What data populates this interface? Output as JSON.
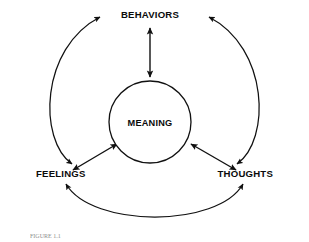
{
  "figure": {
    "background_color": "#ffffff",
    "stroke_color": "#111111",
    "text_color": "#0b0b0b",
    "caption": "FIGURE 1.1"
  },
  "nodes": {
    "top": {
      "label": "BEHAVIORS"
    },
    "left": {
      "label": "FEELINGS"
    },
    "right": {
      "label": "THOUGHTS"
    },
    "center": {
      "label": "MEANING"
    }
  },
  "connectors": {
    "center_top": {
      "name": "meaning-behaviors-arrow",
      "style": "double-headed-straight"
    },
    "center_left": {
      "name": "meaning-feelings-arrow",
      "style": "double-headed-straight"
    },
    "center_right": {
      "name": "meaning-thoughts-arrow",
      "style": "double-headed-straight"
    },
    "outer_left": {
      "name": "feelings-behaviors-arc",
      "style": "double-headed-arc"
    },
    "outer_right": {
      "name": "thoughts-behaviors-arc",
      "style": "double-headed-arc"
    },
    "outer_bottom": {
      "name": "feelings-thoughts-arc",
      "style": "double-headed-arc"
    }
  }
}
